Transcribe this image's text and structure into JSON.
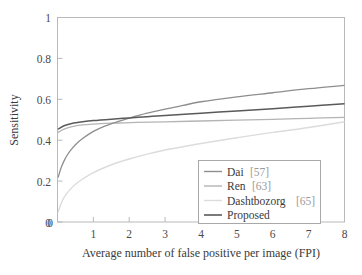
{
  "chart_data": {
    "type": "line",
    "title": "",
    "xlabel": "Average number of false positive per image (FPI)",
    "ylabel": "Sensitivity",
    "xlim": [
      0,
      8
    ],
    "ylim": [
      0,
      1
    ],
    "xticks": [
      "0",
      "1",
      "2",
      "3",
      "4",
      "5",
      "6",
      "7",
      "8"
    ],
    "yticks": [
      "0",
      "0.2",
      "0.4",
      "0.6",
      "0.8",
      "1"
    ],
    "grid": false,
    "legend_position": "lower right",
    "series": [
      {
        "name": "Dai",
        "reference": "[57]",
        "legend_label": "Dai [57]",
        "color": "#8e8e8e",
        "x": [
          0.02,
          0.1,
          0.2,
          0.3,
          0.4,
          0.5,
          0.7,
          1.0,
          1.3,
          1.7,
          2.0,
          2.5,
          3.0,
          3.5,
          4.0,
          5.0,
          6.0,
          7.0,
          8.0
        ],
        "y": [
          0.22,
          0.265,
          0.305,
          0.335,
          0.358,
          0.378,
          0.408,
          0.443,
          0.468,
          0.492,
          0.508,
          0.532,
          0.552,
          0.57,
          0.588,
          0.612,
          0.632,
          0.652,
          0.668
        ]
      },
      {
        "name": "Ren",
        "reference": "[63]",
        "legend_label": "Ren [63]",
        "color": "#b4b4b4",
        "x": [
          0.02,
          0.15,
          0.3,
          0.5,
          0.8,
          1.2,
          1.7,
          2.2,
          3.0,
          4.0,
          5.0,
          6.0,
          7.0,
          8.0
        ],
        "y": [
          0.438,
          0.452,
          0.462,
          0.47,
          0.476,
          0.481,
          0.484,
          0.487,
          0.49,
          0.494,
          0.498,
          0.502,
          0.507,
          0.512
        ]
      },
      {
        "name": "Dashtbozorg",
        "reference": "[65]",
        "legend_label": "Dashtbozorg [65]",
        "color": "#dcdcdc",
        "x": [
          0.02,
          0.1,
          0.2,
          0.4,
          0.6,
          0.9,
          1.2,
          1.6,
          2.0,
          2.5,
          3.0,
          3.5,
          4.0,
          5.0,
          6.0,
          7.0,
          8.0
        ],
        "y": [
          0.05,
          0.09,
          0.125,
          0.168,
          0.198,
          0.232,
          0.258,
          0.286,
          0.308,
          0.332,
          0.352,
          0.368,
          0.384,
          0.412,
          0.438,
          0.462,
          0.49
        ]
      },
      {
        "name": "Proposed",
        "reference": "",
        "legend_label": "Proposed",
        "color": "#5a5a5a",
        "x": [
          0.02,
          0.2,
          0.4,
          0.7,
          1.0,
          1.5,
          2.0,
          2.5,
          3.0,
          4.0,
          5.0,
          6.0,
          7.0,
          8.0
        ],
        "y": [
          0.455,
          0.472,
          0.482,
          0.49,
          0.496,
          0.503,
          0.509,
          0.515,
          0.521,
          0.532,
          0.543,
          0.554,
          0.566,
          0.578
        ]
      }
    ]
  },
  "axes": {
    "ylabel": "Sensitivity",
    "xlabel": "Average number of false positive per image (FPI)"
  },
  "legend": {
    "entries": [
      {
        "label": "Dai",
        "ref": "[57]"
      },
      {
        "label": "Ren",
        "ref": "[63]"
      },
      {
        "label": "Dashtbozorg",
        "ref": "[65]"
      },
      {
        "label": "Proposed",
        "ref": ""
      }
    ]
  },
  "colors": {
    "dai": "#8e8e8e",
    "ren": "#b4b4b4",
    "dashtbozorg": "#dcdcdc",
    "proposed": "#5a5a5a",
    "frame": "#b9b9b9",
    "text": "#3a3a3a",
    "ref_text": "#9a9a9a"
  }
}
